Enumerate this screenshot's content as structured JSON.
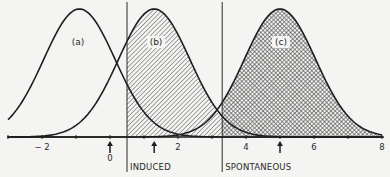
{
  "diagram": {
    "type": "overlapping-normal-distributions",
    "axis": {
      "ticks": [
        -3,
        -2,
        -1,
        0,
        1,
        2,
        3,
        4,
        5,
        6,
        7,
        8
      ],
      "labeled_ticks": [
        {
          "value": -2,
          "label": "− 2"
        },
        {
          "value": 0,
          "label": "0"
        },
        {
          "value": 2,
          "label": "2"
        },
        {
          "value": 4,
          "label": "4"
        },
        {
          "value": 6,
          "label": "6"
        },
        {
          "value": 8,
          "label": "8"
        }
      ],
      "xlim": [
        -3,
        8
      ]
    },
    "curves": [
      {
        "id": "a",
        "label": "(a)",
        "mean": -0.9,
        "fill": "none"
      },
      {
        "id": "b",
        "label": "(b)",
        "mean": 1.3,
        "fill": "diagonal-hatch",
        "fill_from": 0.5
      },
      {
        "id": "c",
        "label": "(c)",
        "mean": 5.0,
        "fill": "cross-hatch",
        "fill_from": 3.3
      }
    ],
    "mean_markers": [
      0,
      1.3,
      5.0
    ],
    "thresholds": [
      {
        "value": 0.5,
        "label": "INDUCED"
      },
      {
        "value": 3.3,
        "label": "SPONTANEOUS"
      }
    ]
  }
}
